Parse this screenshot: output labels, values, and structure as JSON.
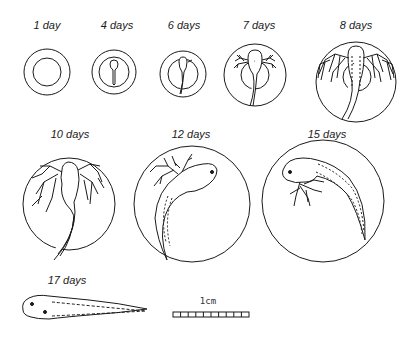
{
  "figure": {
    "stages": [
      {
        "label": "1 day"
      },
      {
        "label": "4 days"
      },
      {
        "label": "6 days"
      },
      {
        "label": "7 days"
      },
      {
        "label": "8 days"
      },
      {
        "label": "10 days"
      },
      {
        "label": "12 days"
      },
      {
        "label": "15 days"
      },
      {
        "label": "17 days"
      }
    ],
    "scale_bar": {
      "label": "1cm",
      "segments": 10
    }
  }
}
